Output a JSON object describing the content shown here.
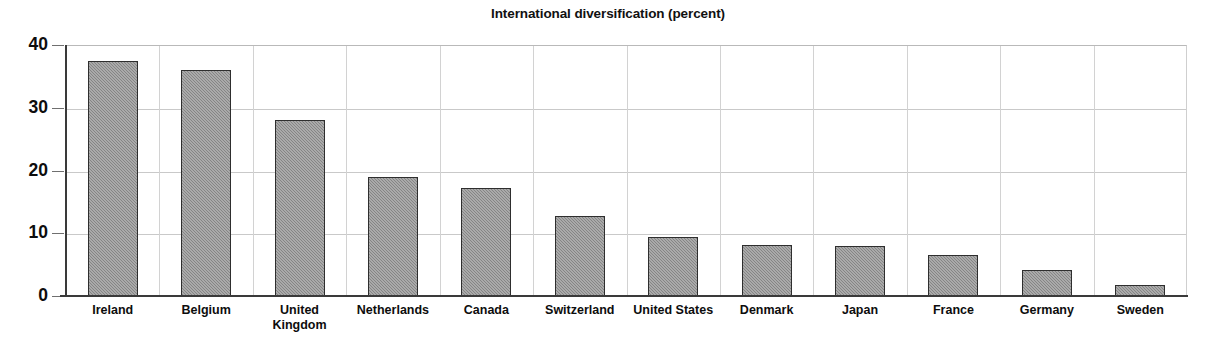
{
  "chart_data": {
    "type": "bar",
    "title": "International diversification (percent)",
    "xlabel": "",
    "ylabel": "",
    "ylim": [
      0,
      40
    ],
    "yticks": [
      0,
      10,
      20,
      30,
      40
    ],
    "grid": "both",
    "legend": "none",
    "bar_color": "#858585",
    "bar_edge_color": "#2e2e2e",
    "categories": [
      "Ireland",
      "Belgium",
      "United Kingdom",
      "Netherlands",
      "Canada",
      "Switzerland",
      "United States",
      "Denmark",
      "Japan",
      "France",
      "Germany",
      "Sweden"
    ],
    "category_label_lines": [
      "Ireland",
      "Belgium",
      "United\nKingdom",
      "Netherlands",
      "Canada",
      "Switzerland",
      "United States",
      "Denmark",
      "Japan",
      "France",
      "Germany",
      "Sweden"
    ],
    "values": [
      37.5,
      36.0,
      28.0,
      19.0,
      17.2,
      12.7,
      9.4,
      8.2,
      8.0,
      6.6,
      4.2,
      1.8
    ]
  },
  "axis": {
    "y_tick_labels": [
      "40",
      "30",
      "20",
      "10",
      "0"
    ]
  }
}
